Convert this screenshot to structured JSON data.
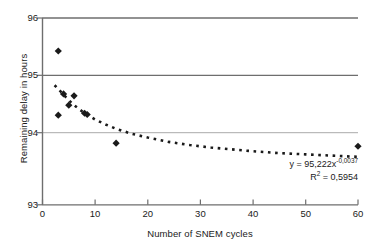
{
  "chart_data": {
    "type": "scatter",
    "title": "",
    "xlabel": "Number of SNEM cycles",
    "ylabel": "Remaining delay in hours",
    "xlim": [
      0,
      60
    ],
    "ylim": [
      93,
      96
    ],
    "xticks": [
      0,
      10,
      20,
      30,
      40,
      50,
      60
    ],
    "yticks": [
      93,
      94,
      95,
      96
    ],
    "grid": "horizontal",
    "legend": "none",
    "series": [
      {
        "name": "Measurements",
        "marker": "diamond",
        "color": "#1a1a1a",
        "x": [
          3,
          3,
          4,
          5,
          6,
          8,
          8.5,
          14,
          60
        ],
        "y": [
          95.47,
          94.44,
          94.78,
          94.6,
          94.75,
          94.47,
          94.45,
          93.99,
          93.94
        ]
      },
      {
        "name": "Power trendline",
        "type": "line",
        "style": "dotted",
        "color": "#1a1a1a",
        "x": [
          2.3,
          3,
          4,
          5,
          6,
          8,
          10,
          12,
          14,
          17,
          20,
          24,
          28,
          32,
          36,
          40,
          45,
          50,
          55,
          60
        ],
        "y": [
          94.92,
          94.86,
          94.77,
          94.68,
          94.6,
          94.47,
          94.37,
          94.29,
          94.22,
          94.14,
          94.08,
          94.01,
          93.96,
          93.92,
          93.89,
          93.86,
          93.83,
          93.81,
          93.79,
          93.77
        ]
      }
    ],
    "annotations": {
      "equation_prefix": "y = 95,222x",
      "equation_exponent": "-0,0037",
      "r_squared_symbol": "R",
      "r_squared_sup": "2",
      "r_squared_value": " = 0,5954"
    }
  },
  "axes": {
    "ytick_labels": [
      "96",
      "95",
      "94",
      "93"
    ],
    "xtick_labels": [
      "0",
      "10",
      "20",
      "30",
      "40",
      "50",
      "60"
    ]
  },
  "colors": {
    "marker": "#1a1a1a",
    "gridline_major": "#6e6e6e",
    "gridline_minor": "#aaaaaa",
    "axis": "#6e6e6e",
    "background": "#ffffff"
  }
}
